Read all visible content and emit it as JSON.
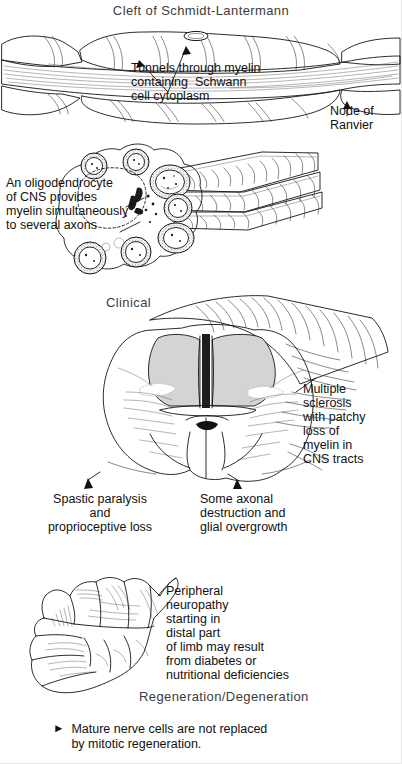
{
  "figure": {
    "title": "Cleft of Schmidt-Lantermann",
    "domain_note": "Histology / neuroanatomy plate: myelin, oligodendrocyte, multiple sclerosis, peripheral neuropathy"
  },
  "panels": {
    "myelin": {
      "title": "Cleft of Schmidt-Lantermann",
      "callout_tunnels": "Tunnels through myelin\ncontaining  Schwann\ncell cytoplasm",
      "callout_node": "Node of\nRanvier"
    },
    "oligodendrocyte": {
      "callout": "An oligodendrocyte\nof CNS provides\nmyelin simultaneously\nto several axons"
    },
    "clinical": {
      "section_header": "Clinical",
      "callout_ms": "Multiple\nsclerosis\nwith patchy\nloss of\nmyelin in\nCNS tracts",
      "callout_left": "Spastic paralysis\nand\nproprioceptive loss",
      "callout_right": "Some axonal\ndestruction and\nglial overgrowth"
    },
    "neuropathy": {
      "callout": "Peripheral\nneuropathy\nstarting in\ndistal part\nof limb may result\nfrom diabetes or\nnutritional deficiencies",
      "section_header": "Regeneration/Degeneration",
      "bullet_marker": "►",
      "bullet_text": "Mature nerve cells are not replaced\nby mitotic regeneration."
    }
  },
  "colors": {
    "ink": "#141414",
    "paper": "#ffffff",
    "gray_matter": "#d4d4d4",
    "stipple": "#6a6a6a",
    "header_text": "#3c3c3c"
  }
}
